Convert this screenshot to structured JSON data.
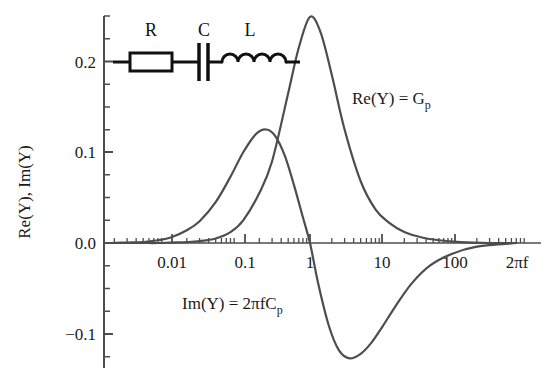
{
  "figure": {
    "background_color": "#ffffff",
    "curve_color": "#4d4d4d",
    "axis_color": "#4d4d4d",
    "text_color": "#1a1a1a",
    "circuit_color": "#111111"
  },
  "axes": {
    "ylabel": "Re(Y), Im(Y)",
    "xlabel": "2πf",
    "y_tick_labels": [
      "0.2",
      "0.1",
      "0.0",
      "−0.1"
    ],
    "y_tick_values": [
      0.2,
      0.1,
      0.0,
      -0.1
    ],
    "x_tick_labels": [
      "0.01",
      "0.1",
      "1",
      "10",
      "100"
    ],
    "x_tick_values": [
      0.01,
      0.1,
      1,
      10,
      100
    ]
  },
  "annotations": {
    "re_label_main": "Re(Y) = G",
    "re_label_sub": "p",
    "im_label_main": "Im(Y) = 2πfC",
    "im_label_sub": "p"
  },
  "circuit": {
    "resistor_label": "R",
    "capacitor_label": "C",
    "inductor_label": "L"
  },
  "chart_data": {
    "type": "line",
    "title": "",
    "xlabel": "2πf",
    "ylabel": "Re(Y), Im(Y)",
    "xscale": "log",
    "xlim": [
      0.0018,
      700
    ],
    "ylim": [
      -0.145,
      0.272
    ],
    "grid": false,
    "legend": "annotations-on-plot",
    "series": [
      {
        "name": "Re(Y) = Gp",
        "color": "#4d4d4d",
        "x": [
          0.0018,
          0.003,
          0.005,
          0.008,
          0.012,
          0.02,
          0.03,
          0.05,
          0.08,
          0.12,
          0.2,
          0.3,
          0.5,
          0.7,
          1.0,
          1.4,
          2.0,
          3.0,
          5.0,
          8.0,
          12.0,
          20.0,
          35.0,
          60.0,
          120.0,
          300.0,
          700.0
        ],
        "y": [
          0.0,
          0.0,
          0.0,
          0.0,
          0.0005,
          0.001,
          0.002,
          0.005,
          0.012,
          0.025,
          0.055,
          0.09,
          0.165,
          0.215,
          0.249,
          0.232,
          0.185,
          0.125,
          0.068,
          0.037,
          0.023,
          0.012,
          0.006,
          0.003,
          0.001,
          0.0,
          0.0
        ],
        "peak": {
          "x": 1.0,
          "y": 0.249
        }
      },
      {
        "name": "Im(Y) = 2πfCp",
        "color": "#4d4d4d",
        "x": [
          0.0018,
          0.003,
          0.005,
          0.008,
          0.012,
          0.02,
          0.03,
          0.05,
          0.08,
          0.12,
          0.18,
          0.25,
          0.33,
          0.45,
          0.6,
          0.8,
          1.0,
          1.3,
          1.8,
          2.5,
          3.5,
          5.0,
          7.0,
          10.0,
          15.0,
          25.0,
          45.0,
          90.0,
          200.0,
          700.0
        ],
        "y": [
          0.0,
          0.0005,
          0.001,
          0.003,
          0.006,
          0.014,
          0.024,
          0.045,
          0.073,
          0.1,
          0.12,
          0.125,
          0.118,
          0.096,
          0.064,
          0.028,
          0.0,
          -0.045,
          -0.09,
          -0.118,
          -0.127,
          -0.122,
          -0.11,
          -0.092,
          -0.07,
          -0.045,
          -0.025,
          -0.012,
          -0.004,
          0.0
        ],
        "peak": {
          "x": 0.25,
          "y": 0.125
        },
        "trough": {
          "x": 3.5,
          "y": -0.127
        },
        "zero_crossing": {
          "x": 1.0,
          "y": 0.0
        }
      }
    ]
  }
}
